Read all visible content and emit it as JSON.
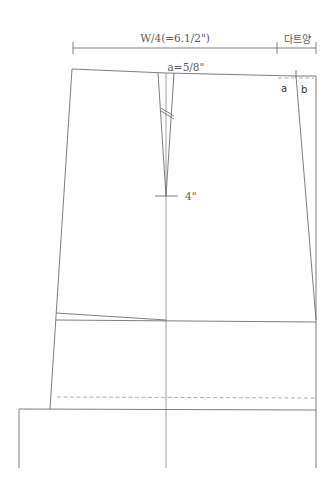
{
  "diagram": {
    "type": "skirt-pattern-draft",
    "labels": {
      "waist_measure": "W/4(=6.1/2\")",
      "dart_amount": "다트양",
      "dart_width": "a=5/8\"",
      "dart_length": "4\"",
      "point_a": "a",
      "point_b": "b"
    },
    "colors": {
      "line": "#6e6e6e",
      "text": "#5a5a5a",
      "background": "#ffffff"
    }
  }
}
